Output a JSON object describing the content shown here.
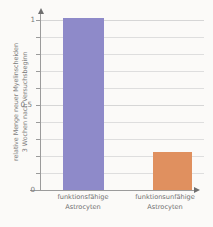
{
  "chart_data": {
    "type": "bar",
    "title": "",
    "subtitle": "",
    "xlabel": "",
    "ylabel_line1": "relative Menge neuer Myelinscheiden",
    "ylabel_line2": "3 Wochen nach Versuchsbeginn",
    "categories": [
      "funktionsfähige Astrocyten",
      "funktionsunfähige Astrocyten"
    ],
    "category_lines": [
      [
        "funktionsfähige",
        "Astrocyten"
      ],
      [
        "funktionsunfähige",
        "Astrocyten"
      ]
    ],
    "values": [
      1.0,
      0.21
    ],
    "bar_colors": [
      "#8e8ac9",
      "#e0905f"
    ],
    "ylim": [
      0,
      1
    ],
    "ytick_values": [
      0,
      0.1,
      0.2,
      0.3,
      0.4,
      0.5,
      0.6,
      0.7,
      0.8,
      0.9,
      1
    ],
    "ytick_labels_visible": [
      "0",
      "0,5",
      "1"
    ],
    "ytick_label_positions": [
      0,
      0.5,
      1
    ],
    "grid": true,
    "grid_color": "#d8d8d8",
    "legend": "none",
    "axis_color": "#9b9b9b",
    "background": "#fbfaf8",
    "y_axis_arrow": true,
    "x_axis_arrow": true
  },
  "axis": {
    "tick_0": "0",
    "tick_half": "0,5",
    "tick_1": "1"
  }
}
